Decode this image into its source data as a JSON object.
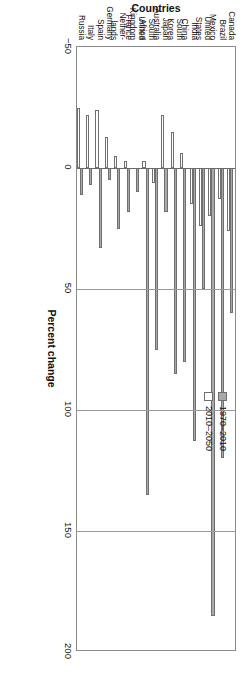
{
  "chart_data": {
    "type": "bar",
    "title": "",
    "subtitle": "",
    "orientation": "vertical",
    "xlabel": "Countries",
    "ylabel": "Percent change",
    "ylim": [
      -50,
      200
    ],
    "yticks": [
      -50,
      0,
      50,
      100,
      150,
      200
    ],
    "ytick_labels": [
      "−50",
      "0",
      "50",
      "100",
      "150",
      "200"
    ],
    "grid": true,
    "legend_position": "upper-right",
    "categories": [
      "Canada",
      "Brazil",
      "Mexico",
      "United\nStates",
      "India",
      "China",
      "South\nKorea",
      "Japan",
      "Australia",
      "South\nAfrica",
      "United\nKingdom",
      "France",
      "Nether-\nlands",
      "Germany",
      "Spain",
      "Italy",
      "Russia"
    ],
    "series": [
      {
        "name": "1970–2010",
        "color": "#a9a9a9",
        "values": [
          60,
          120,
          185,
          50,
          113,
          80,
          85,
          18,
          75,
          135,
          10,
          18,
          25,
          5,
          33,
          7,
          11
        ]
      },
      {
        "name": "2010–2050",
        "color": "#ffffff",
        "values": [
          26,
          13,
          20,
          24,
          15,
          -6,
          -15,
          -22,
          6,
          -3,
          0,
          -3,
          -5,
          -13,
          -24,
          -22,
          -25
        ]
      }
    ]
  },
  "axis": {
    "value_axis_title": "Percent change",
    "category_axis_title": "Countries"
  },
  "legend": {
    "items": [
      {
        "label": "1970–2010",
        "swatch": "gray-filled-square"
      },
      {
        "label": "2010–2050",
        "swatch": "white-open-square"
      }
    ]
  }
}
